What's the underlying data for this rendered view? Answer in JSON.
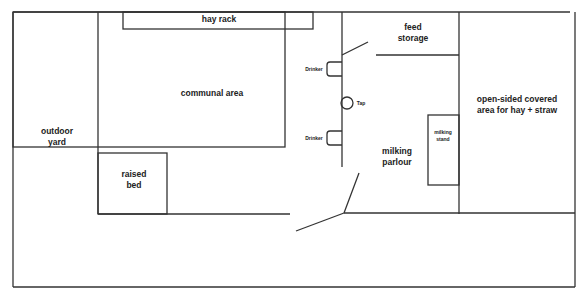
{
  "diagram": {
    "type": "floor-plan",
    "line_color": "#333333",
    "areas": {
      "outdoor_yard": [
        "outdoor",
        "yard"
      ],
      "hay_rack": "hay rack",
      "communal_area": "communal area",
      "feed_storage": [
        "feed",
        "storage"
      ],
      "open_sided": [
        "open-sided covered",
        "area for hay + straw"
      ],
      "raised_bed": [
        "raised",
        "bed"
      ],
      "milking_parlour": [
        "milking",
        "parlour"
      ],
      "milking_stand": [
        "milking",
        "stand"
      ]
    },
    "fixtures": {
      "drinker_top": "Drinker",
      "drinker_bottom": "Drinker",
      "tap": "Tap"
    }
  }
}
